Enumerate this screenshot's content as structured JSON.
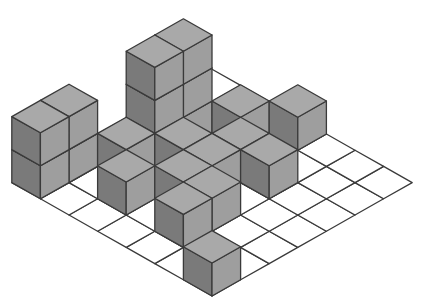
{
  "diagram": {
    "type": "isometric-cube-arrangement",
    "grid": {
      "cols_u": 7,
      "cols_v": 7
    },
    "colors": {
      "background": "#ffffff",
      "grid_fill": "#ffffff",
      "line": "#3a3a3a",
      "top_face": "#a9a9a9",
      "left_face": "#7a7a7a",
      "right_face": "#9e9e9e"
    },
    "cubes": [
      {
        "i": 0,
        "j": 6,
        "h": 2
      },
      {
        "i": 1,
        "j": 6,
        "h": 2
      },
      {
        "i": 3,
        "j": 5,
        "h": 3
      },
      {
        "i": 4,
        "j": 5,
        "h": 3
      },
      {
        "i": 2,
        "j": 5,
        "h": 1
      },
      {
        "i": 3,
        "j": 4,
        "h": 1
      },
      {
        "i": 5,
        "j": 4,
        "h": 1
      },
      {
        "i": 1,
        "j": 4,
        "h": 1
      },
      {
        "i": 2,
        "j": 3,
        "h": 1
      },
      {
        "i": 3,
        "j": 3,
        "h": 1
      },
      {
        "i": 4,
        "j": 3,
        "h": 1
      },
      {
        "i": 4,
        "j": 2,
        "h": 1
      },
      {
        "i": 6,
        "j": 3,
        "h": 1
      },
      {
        "i": 1,
        "j": 2,
        "h": 1
      },
      {
        "i": 2,
        "j": 2,
        "h": 1
      },
      {
        "i": 0,
        "j": 0,
        "h": 1
      }
    ]
  }
}
